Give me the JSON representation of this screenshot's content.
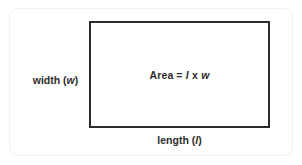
{
  "diagram": {
    "type": "rectangle-area-diagram",
    "shape": {
      "name": "rectangle",
      "border_color": "#2b2b2b"
    },
    "card": {
      "background": "#ffffff",
      "border_color": "#f0f0f0"
    },
    "labels": {
      "width": {
        "text": "width (",
        "variable": "w",
        "text_end": ")",
        "full": "width (w)"
      },
      "length": {
        "text": "length (",
        "variable": "l",
        "text_end": ")",
        "full": "length (l)"
      },
      "area_formula": {
        "lead": "Area =",
        "var1": "l",
        "operator": "x",
        "var2": "w",
        "full": "Area = l x w"
      }
    },
    "text_color": "#2d2d2d"
  }
}
